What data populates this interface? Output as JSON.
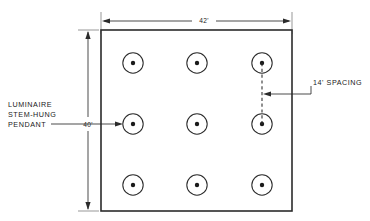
{
  "drawing": {
    "title": "lighting-layout-plan",
    "room": {
      "width_label": "42'",
      "height_label": "40'"
    },
    "annotations": {
      "luminaire_label_line1": "LUMINAIRE",
      "luminaire_label_line2": "STEM-HUNG",
      "luminaire_label_line3": "PENDANT",
      "spacing_label": "14' SPACING"
    },
    "luminaires": [
      {
        "row": 0,
        "col": 0,
        "cx": 133,
        "cy": 63
      },
      {
        "row": 0,
        "col": 1,
        "cx": 197,
        "cy": 63
      },
      {
        "row": 0,
        "col": 2,
        "cx": 262,
        "cy": 63
      },
      {
        "row": 1,
        "col": 0,
        "cx": 133,
        "cy": 124
      },
      {
        "row": 1,
        "col": 1,
        "cx": 197,
        "cy": 124
      },
      {
        "row": 1,
        "col": 2,
        "cx": 262,
        "cy": 124
      },
      {
        "row": 2,
        "col": 0,
        "cx": 133,
        "cy": 185
      },
      {
        "row": 2,
        "col": 1,
        "cx": 197,
        "cy": 185
      },
      {
        "row": 2,
        "col": 2,
        "cx": 262,
        "cy": 185
      }
    ],
    "colors": {
      "ink": "#2b2b2b",
      "paper": "#ffffff",
      "extension": "#6a6a6a"
    }
  }
}
